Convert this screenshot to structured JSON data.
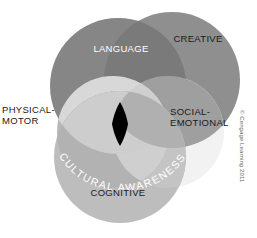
{
  "figure": {
    "center_label": "CULTURAL AWARENESS",
    "copyright": "© Cengage Learning 2011"
  },
  "labels": {
    "language": "LANGUAGE",
    "creative": "CREATIVE",
    "physical_motor_line1": "PHYSICAL-",
    "physical_motor_line2": "MOTOR",
    "social_emotional_line1": "SOCIAL-",
    "social_emotional_line2": "EMOTIONAL",
    "cognitive": "COGNITIVE"
  },
  "circles": [
    {
      "name": "language",
      "label": "LANGUAGE",
      "cx": 118,
      "cy": 86,
      "r": 68,
      "fill": "#8a8a8a"
    },
    {
      "name": "creative",
      "label": "CREATIVE",
      "cx": 172,
      "cy": 80,
      "r": 68,
      "fill": "#8f8f8f"
    },
    {
      "name": "physical-motor",
      "label": "PHYSICAL-MOTOR",
      "cx": 113,
      "cy": 132,
      "r": 56,
      "fill": "#b4b4b4"
    },
    {
      "name": "social-emotional",
      "label": "SOCIAL-EMOTIONAL",
      "cx": 168,
      "cy": 132,
      "r": 56,
      "fill": "#ededed"
    },
    {
      "name": "cognitive",
      "label": "COGNITIVE",
      "cx": 120,
      "cy": 157,
      "r": 66,
      "fill": "#bdbdbd"
    }
  ],
  "center_lens": {
    "name": "cultural-awareness-core",
    "fill": "#000000",
    "cx": 120,
    "cy": 124,
    "rx": 8,
    "ry": 22
  },
  "colors": {
    "background": "#ffffff",
    "dark_gray": "#8a8a8a",
    "mid_gray": "#a0a0a0",
    "light_gray": "#bdbdbd",
    "pale_gray": "#ededed",
    "core_black": "#000000",
    "label_dark": "#1a1a1a",
    "label_light": "#ffffff",
    "copyright_gray": "#6b6b6b"
  }
}
